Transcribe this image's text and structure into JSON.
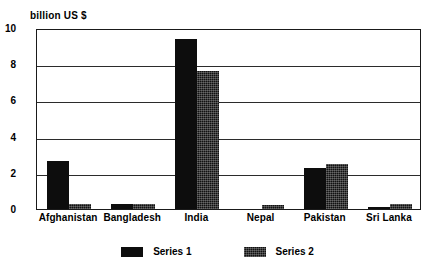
{
  "chart_data": {
    "type": "bar",
    "title": "",
    "ylabel": "billion US $",
    "xlabel": "",
    "ylim": [
      0,
      10
    ],
    "yticks": [
      0,
      2,
      4,
      6,
      8,
      10
    ],
    "ytick_labels": [
      "0",
      "2",
      "4",
      "6",
      "8",
      "10"
    ],
    "grid": true,
    "legend_position": "bottom",
    "categories": [
      "Afghanistan",
      "Bangladesh",
      "India",
      "Nepal",
      "Pakistan",
      "Sri Lanka"
    ],
    "series": [
      {
        "name": "Series 1",
        "color": "#0d0d0d",
        "values": [
          2.65,
          0.3,
          9.4,
          0.0,
          2.25,
          0.1
        ]
      },
      {
        "name": "Series 2",
        "color": "#111111",
        "values": [
          0.3,
          0.3,
          7.6,
          0.2,
          2.5,
          0.3
        ]
      }
    ]
  }
}
